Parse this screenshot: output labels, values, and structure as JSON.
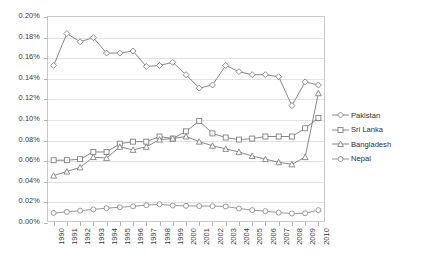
{
  "chart_data": {
    "type": "line",
    "title": "",
    "xlabel": "",
    "ylabel": "",
    "ylim": [
      0,
      0.2
    ],
    "ytick_labels": [
      "0.20%",
      "0.18%",
      "0.16%",
      "0.14%",
      "0.12%",
      "0.10%",
      "0.08%",
      "0.06%",
      "0.04%",
      "0.02%",
      "0.00%"
    ],
    "ytick_values": [
      0.2,
      0.18,
      0.16,
      0.14,
      0.12,
      0.1,
      0.08,
      0.06,
      0.04,
      0.02,
      0.0
    ],
    "grid": true,
    "legend_position": "right",
    "x": [
      "1990",
      "1991",
      "1992",
      "1993",
      "1994",
      "1995",
      "1996",
      "1997",
      "1998",
      "1999",
      "2000",
      "2001",
      "2002",
      "2003",
      "2004",
      "2005",
      "2006",
      "2007",
      "2008",
      "2009",
      "2010"
    ],
    "categories": [
      "1990",
      "1991",
      "1992",
      "1993",
      "1994",
      "1995",
      "1996",
      "1997",
      "1998",
      "1999",
      "2000",
      "2001",
      "2002",
      "2003",
      "2004",
      "2005",
      "2006",
      "2007",
      "2008",
      "2009",
      "2010"
    ],
    "series": [
      {
        "name": "Pakistan",
        "marker": "diamond",
        "color": "#7a7a7a",
        "values": [
          0.152,
          0.183,
          0.175,
          0.179,
          0.164,
          0.164,
          0.166,
          0.151,
          0.152,
          0.155,
          0.143,
          0.13,
          0.133,
          0.152,
          0.146,
          0.143,
          0.143,
          0.141,
          0.113,
          0.136,
          0.133
        ]
      },
      {
        "name": "Sri Lanka",
        "marker": "square",
        "color": "#7a7a7a",
        "values": [
          0.06,
          0.06,
          0.061,
          0.068,
          0.068,
          0.076,
          0.078,
          0.078,
          0.083,
          0.081,
          0.088,
          0.098,
          0.086,
          0.082,
          0.08,
          0.081,
          0.083,
          0.083,
          0.083,
          0.091,
          0.101
        ]
      },
      {
        "name": "Bangladesh",
        "marker": "triangle",
        "color": "#7a7a7a",
        "values": [
          0.045,
          0.049,
          0.053,
          0.063,
          0.062,
          0.073,
          0.07,
          0.073,
          0.08,
          0.081,
          0.083,
          0.078,
          0.074,
          0.071,
          0.068,
          0.064,
          0.061,
          0.058,
          0.056,
          0.063,
          0.125
        ]
      },
      {
        "name": "Nepal",
        "marker": "circle",
        "color": "#8a8a8a",
        "values": [
          0.0088,
          0.0098,
          0.011,
          0.0122,
          0.0134,
          0.0143,
          0.0152,
          0.0163,
          0.0172,
          0.016,
          0.0157,
          0.0155,
          0.0154,
          0.0151,
          0.0131,
          0.0115,
          0.0105,
          0.0091,
          0.0083,
          0.0085,
          0.0115
        ]
      }
    ],
    "legend_entries": [
      "Pakistan",
      "Sri Lanka",
      "Bangladesh",
      "Nepal"
    ]
  }
}
